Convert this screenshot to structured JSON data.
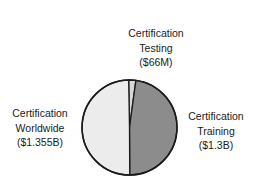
{
  "chart_data": {
    "type": "pie",
    "title": "",
    "slices": [
      {
        "label": "Certification Testing",
        "value_label": "($66M)",
        "value": 66,
        "unit": "M USD",
        "color": "#d8d8d8"
      },
      {
        "label": "Certification Training",
        "value_label": "($1.3B)",
        "value": 1300,
        "unit": "M USD",
        "color": "#8c8c8c"
      },
      {
        "label": "Certification Worldwide",
        "value_label": "($1.355B)",
        "value": 1355,
        "unit": "M USD",
        "color": "#ececec"
      }
    ],
    "legend": "none (direct labels)",
    "start_angle_deg": -1,
    "direction": "clockwise"
  },
  "labels": {
    "testing": {
      "line1": "Certification",
      "line2": "Testing",
      "line3": "($66M)"
    },
    "worldwide": {
      "line1": "Certification",
      "line2": "Worldwide",
      "line3": "($1.355B)"
    },
    "training": {
      "line1": "Certification",
      "line2": "Training",
      "line3": "($1.3B)"
    }
  }
}
